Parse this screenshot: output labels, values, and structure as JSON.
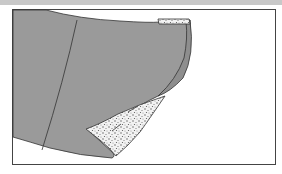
{
  "figure": {
    "colors": {
      "fabric": "#9a9a9a",
      "outline": "#333333",
      "interfacing": "#e8e8e8",
      "frame": "#444444",
      "topbar": "#c8c8c8"
    }
  }
}
